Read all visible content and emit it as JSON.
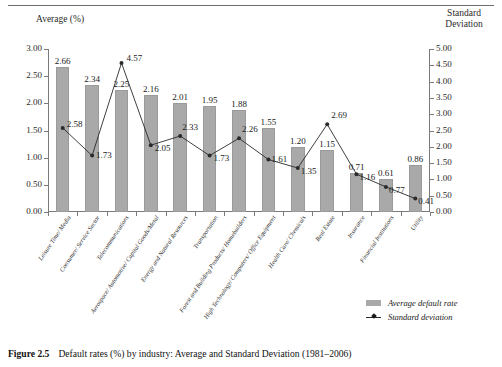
{
  "figure": {
    "number": "Figure 2.5",
    "caption": "Default rates (%) by industry: Average and Standard Deviation (1981–2006)"
  },
  "legend": {
    "average_label": "Average default rate",
    "stddev_label": "Standard deviation"
  },
  "axis_titles": {
    "left": "Average (%)",
    "right_line1": "Standard",
    "right_line2": "Deviation"
  },
  "colors": {
    "bar_fill": "#a9a9a9",
    "line": "#2a2a2a",
    "axis": "#7a7a7a",
    "text": "#1a1a1a"
  },
  "chart_data": {
    "type": "bar",
    "title": "Default rates (%) by industry: Average and Standard Deviation (1981–2006)",
    "xlabel": "",
    "ylabel": "Average (%)",
    "y2label": "Standard Deviation",
    "ylim": [
      0,
      3.0
    ],
    "y2lim": [
      0,
      5.0
    ],
    "yticks": [
      "0.00",
      "0.50",
      "1.00",
      "1.50",
      "2.00",
      "2.50",
      "3.00"
    ],
    "y2ticks": [
      "0.00",
      "0.50",
      "1.00",
      "1.50",
      "2.00",
      "2.50",
      "3.00",
      "3.50",
      "4.00",
      "4.50",
      "5.00"
    ],
    "grid": false,
    "legend_position": "bottom-right",
    "categories": [
      "Leisure Time/ Media",
      "Consumer/ Service Sector",
      "Telecommunications",
      "Aerospace/ Automotive/ Capital Goods/Metal",
      "Energy and Natural Resources",
      "Transportation",
      "Forest and Building Products/ Homebuilders",
      "High Technology/ Computers/ Office Equipment",
      "Health Care/ Chemicals",
      "Real Estate",
      "Insurance",
      "Financial Institutions",
      "Utility"
    ],
    "series": [
      {
        "name": "Average default rate",
        "axis": "left",
        "type": "bar",
        "values": [
          2.66,
          2.34,
          2.25,
          2.16,
          2.01,
          1.95,
          1.88,
          1.55,
          1.2,
          1.15,
          0.71,
          0.61,
          0.86
        ],
        "labels": [
          "2.66",
          "2.34",
          "2.25",
          "2.16",
          "2.01",
          "1.95",
          "1.88",
          "1.55",
          "1.20",
          "1.15",
          "0.71",
          "0.61",
          "0.86"
        ]
      },
      {
        "name": "Standard deviation",
        "axis": "right",
        "type": "line",
        "values": [
          2.58,
          1.73,
          4.57,
          2.05,
          2.33,
          1.73,
          2.26,
          1.61,
          1.35,
          2.69,
          1.16,
          0.77,
          0.41
        ],
        "labels": [
          "2.58",
          "1.73",
          "4.57",
          "2.05",
          "2.33",
          "1.73",
          "2.26",
          "1.61",
          "1.35",
          "2.69",
          "1.16",
          "0.77",
          "0.41"
        ]
      }
    ]
  }
}
